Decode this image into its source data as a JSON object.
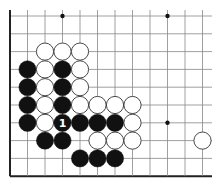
{
  "diagram": {
    "type": "go-board-fragment",
    "grid": {
      "origin_x": 10,
      "origin_y": 16,
      "spacing_x": 17.5,
      "spacing_y": 17.8,
      "cols": 12,
      "rows": 10,
      "line_right_x": 212,
      "edges": [
        "left",
        "bottom"
      ],
      "line_color": "#888888",
      "edge_color": "#222222"
    },
    "star_points": [
      {
        "col": 3,
        "row": 0
      },
      {
        "col": 9,
        "row": 0
      },
      {
        "col": 9,
        "row": 6
      }
    ],
    "stones": [
      {
        "color": "white",
        "col": 2,
        "row": 2
      },
      {
        "color": "white",
        "col": 3,
        "row": 2
      },
      {
        "color": "white",
        "col": 4,
        "row": 2
      },
      {
        "color": "black",
        "col": 1,
        "row": 3
      },
      {
        "color": "white",
        "col": 2,
        "row": 3
      },
      {
        "color": "black",
        "col": 3,
        "row": 3
      },
      {
        "color": "white",
        "col": 4,
        "row": 3
      },
      {
        "color": "black",
        "col": 1,
        "row": 4
      },
      {
        "color": "white",
        "col": 2,
        "row": 4
      },
      {
        "color": "black",
        "col": 3,
        "row": 4
      },
      {
        "color": "white",
        "col": 4,
        "row": 4
      },
      {
        "color": "black",
        "col": 1,
        "row": 5
      },
      {
        "color": "white",
        "col": 2,
        "row": 5
      },
      {
        "color": "black",
        "col": 3,
        "row": 5
      },
      {
        "color": "white",
        "col": 4,
        "row": 5
      },
      {
        "color": "white",
        "col": 5,
        "row": 5
      },
      {
        "color": "white",
        "col": 6,
        "row": 5
      },
      {
        "color": "white",
        "col": 7,
        "row": 5
      },
      {
        "color": "black",
        "col": 1,
        "row": 6
      },
      {
        "color": "white",
        "col": 2,
        "row": 6
      },
      {
        "color": "black",
        "col": 3,
        "row": 6,
        "label": "1"
      },
      {
        "color": "black",
        "col": 4,
        "row": 6
      },
      {
        "color": "black",
        "col": 5,
        "row": 6
      },
      {
        "color": "black",
        "col": 6,
        "row": 6
      },
      {
        "color": "white",
        "col": 7,
        "row": 6
      },
      {
        "color": "black",
        "col": 2,
        "row": 7
      },
      {
        "color": "black",
        "col": 3,
        "row": 7
      },
      {
        "color": "white",
        "col": 5,
        "row": 7
      },
      {
        "color": "white",
        "col": 6,
        "row": 7
      },
      {
        "color": "white",
        "col": 7,
        "row": 7
      },
      {
        "color": "white",
        "col": 11,
        "row": 7
      },
      {
        "color": "black",
        "col": 4,
        "row": 8
      },
      {
        "color": "black",
        "col": 5,
        "row": 8
      },
      {
        "color": "black",
        "col": 6,
        "row": 8
      }
    ],
    "colors": {
      "black_stone": "#111111",
      "white_stone": "#ffffff",
      "white_stroke": "#333333",
      "label_on_black": "#ffffff"
    }
  }
}
